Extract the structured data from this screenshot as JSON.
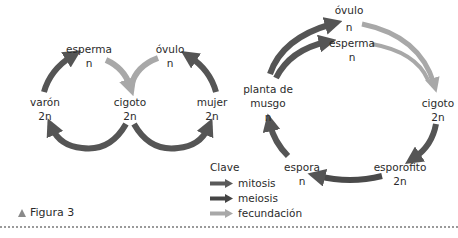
{
  "colors": {
    "mitosis": "#5a5a5a",
    "meiosis": "#4a4a4a",
    "fecundacion": "#a8a8a8",
    "text": "#2b2b2b"
  },
  "human_cycle": {
    "esperma": {
      "name": "esperma",
      "ploidy": "n"
    },
    "ovulo": {
      "name": "óvulo",
      "ploidy": "n"
    },
    "varon": {
      "name": "varón",
      "ploidy": "2n"
    },
    "cigoto": {
      "name": "cigoto",
      "ploidy": "2n"
    },
    "mujer": {
      "name": "mujer",
      "ploidy": "2n"
    }
  },
  "moss_cycle": {
    "ovulo": {
      "name": "óvulo",
      "ploidy": "n"
    },
    "esperma": {
      "name": "esperma",
      "ploidy": "n"
    },
    "planta": {
      "name_line1": "planta de",
      "name_line2": "musgo",
      "ploidy": "n"
    },
    "cigoto": {
      "name": "cigoto",
      "ploidy": "2n"
    },
    "esporofito": {
      "name": "esporofito",
      "ploidy": "2n"
    },
    "espora": {
      "name": "espora",
      "ploidy": "n"
    }
  },
  "legend": {
    "title": "Clave",
    "items": [
      {
        "label": "mitosis",
        "type": "mitosis"
      },
      {
        "label": "meiosis",
        "type": "meiosis"
      },
      {
        "label": "fecundación",
        "type": "fecundacion"
      }
    ]
  },
  "caption": {
    "label": "Figura 3"
  }
}
